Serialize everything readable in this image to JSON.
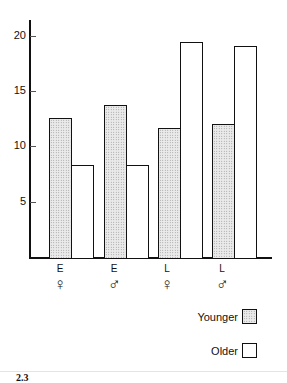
{
  "chart_data": {
    "type": "bar",
    "title": "",
    "xlabel": "",
    "ylabel": "",
    "ylim": [
      0,
      21
    ],
    "yticks": [
      5,
      10,
      15,
      20
    ],
    "grid": false,
    "legend_position": "bottom-right",
    "categories": [
      {
        "group": "E",
        "sex": "♀"
      },
      {
        "group": "E",
        "sex": "♂"
      },
      {
        "group": "L",
        "sex": "♀"
      },
      {
        "group": "L",
        "sex": "♂"
      }
    ],
    "series": [
      {
        "name": "Younger",
        "pattern": "stippled",
        "values": [
          12.6,
          13.8,
          11.7,
          12.1
        ]
      },
      {
        "name": "Older",
        "pattern": "open",
        "values": [
          8.4,
          8.4,
          19.5,
          19.1
        ]
      }
    ]
  },
  "axis": {
    "ticks": [
      "5",
      "10",
      "15",
      "20"
    ]
  },
  "x_labels": [
    {
      "letter": "E",
      "sex": "♀"
    },
    {
      "letter": "E",
      "sex": "♂"
    },
    {
      "letter": "L",
      "sex": "♀"
    },
    {
      "letter": "L",
      "sex": "♂"
    }
  ],
  "legend": {
    "younger": "Younger",
    "older": "Older"
  },
  "figure_label": "2.3"
}
